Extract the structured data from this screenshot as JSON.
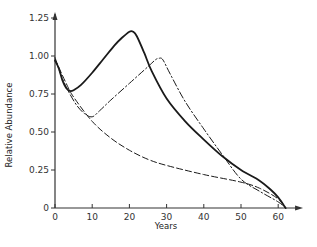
{
  "chart_data": {
    "type": "line",
    "title": "",
    "xlabel": "Years",
    "ylabel": "Relative Abundance",
    "xlim": [
      0,
      64
    ],
    "ylim": [
      0,
      1.25
    ],
    "grid": false,
    "legend": null,
    "x_ticks": [
      0,
      10,
      20,
      30,
      40,
      50,
      60
    ],
    "x_tick_labels": [
      "0",
      "10",
      "20",
      "30",
      "40",
      "50",
      "60"
    ],
    "y_ticks": [
      0,
      0.25,
      0.5,
      0.75,
      1.0,
      1.25
    ],
    "y_tick_labels": [
      "0",
      "0.25",
      "0.50",
      "0.75",
      "1.00",
      "1.25"
    ],
    "series": [
      {
        "name": "solid",
        "style": "solid",
        "x": [
          0,
          1,
          2,
          3,
          4,
          5,
          7,
          10,
          13,
          16,
          18,
          20,
          21,
          22,
          24,
          26,
          30,
          35,
          40,
          45,
          50,
          55,
          58,
          60,
          62
        ],
        "values": [
          0.97,
          0.92,
          0.84,
          0.79,
          0.77,
          0.775,
          0.81,
          0.89,
          0.98,
          1.07,
          1.12,
          1.16,
          1.16,
          1.13,
          1.02,
          0.9,
          0.72,
          0.57,
          0.45,
          0.34,
          0.25,
          0.18,
          0.12,
          0.07,
          0.0
        ]
      },
      {
        "name": "dash-dot",
        "style": "dashdot",
        "x": [
          0,
          2,
          4,
          6,
          8,
          10,
          12,
          15,
          20,
          25,
          27,
          28,
          29,
          31,
          35,
          40,
          45,
          50,
          55,
          60,
          62
        ],
        "values": [
          0.99,
          0.85,
          0.75,
          0.67,
          0.62,
          0.6,
          0.64,
          0.71,
          0.82,
          0.93,
          0.975,
          0.985,
          0.975,
          0.88,
          0.7,
          0.52,
          0.35,
          0.19,
          0.11,
          0.04,
          0.0
        ]
      },
      {
        "name": "dashed",
        "style": "dashed",
        "x": [
          0,
          3,
          5,
          10,
          15,
          20,
          25,
          30,
          40,
          50,
          55,
          60,
          62
        ],
        "values": [
          0.98,
          0.82,
          0.73,
          0.57,
          0.46,
          0.38,
          0.32,
          0.28,
          0.22,
          0.17,
          0.13,
          0.06,
          0.0
        ]
      }
    ]
  },
  "colors": {
    "line": "#1a1a1a",
    "axis": "#333333",
    "background": "#ffffff"
  }
}
